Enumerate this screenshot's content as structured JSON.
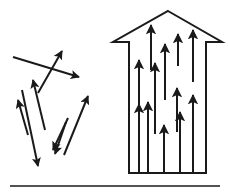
{
  "figure": {
    "canvas": {
      "width": 228,
      "height": 193,
      "background": "#ffffff"
    },
    "stroke_color": "#1a1a1a",
    "panels": [
      {
        "id": "disordered-vectors-panel",
        "name": "random-arrow-cluster",
        "label": "",
        "description": "cluster of randomly oriented arrows",
        "arrow_count": 8,
        "arrow_stroke_width": 2.0,
        "arrows": [
          {
            "name": "arrow-long-right-down",
            "x1": 13,
            "y1": 57,
            "x2": 79,
            "y2": 77
          },
          {
            "name": "arrow-up-right-steep",
            "x1": 38,
            "y1": 93,
            "x2": 62,
            "y2": 51
          },
          {
            "name": "arrow-up-left-mid",
            "x1": 45,
            "y1": 130,
            "x2": 33,
            "y2": 80
          },
          {
            "name": "arrow-up-left-lower",
            "x1": 28,
            "y1": 135,
            "x2": 18,
            "y2": 100
          },
          {
            "name": "arrow-down-left-long",
            "x1": 22,
            "y1": 90,
            "x2": 38,
            "y2": 166
          },
          {
            "name": "arrow-down-left-short",
            "x1": 68,
            "y1": 118,
            "x2": 53,
            "y2": 150
          },
          {
            "name": "arrow-down-left-thin",
            "x1": 66,
            "y1": 122,
            "x2": 55,
            "y2": 154
          },
          {
            "name": "arrow-up-right-lower",
            "x1": 64,
            "y1": 155,
            "x2": 88,
            "y2": 96
          }
        ]
      },
      {
        "id": "aligned-vectors-panel",
        "name": "arrow-outline-with-aligned-arrows",
        "label": "",
        "description": "large upward arrow outline filled with parallel upward arrows",
        "outline": {
          "name": "big-arrow-outline",
          "stroke_width": 2.0,
          "apex_x": 168,
          "apex_y": 11,
          "wing_left_x": 113,
          "wing_right_x": 222,
          "wing_y": 42,
          "body_left_x": 129,
          "body_right_x": 206,
          "body_bottom_y": 173,
          "points": "168,11 222,42 206,42 206,173 129,173 129,42 113,42"
        },
        "arrow_count": 12,
        "arrow_stroke_width": 2.0,
        "arrows": [
          {
            "name": "aligned-arrow-1",
            "x": 139,
            "y_tail": 112,
            "y_head": 60
          },
          {
            "name": "aligned-arrow-2",
            "x": 139,
            "y_tail": 172,
            "y_head": 104
          },
          {
            "name": "aligned-arrow-3",
            "x": 151,
            "y_tail": 70,
            "y_head": 25
          },
          {
            "name": "aligned-arrow-4",
            "x": 155,
            "y_tail": 134,
            "y_head": 63
          },
          {
            "name": "aligned-arrow-5",
            "x": 148,
            "y_tail": 172,
            "y_head": 102
          },
          {
            "name": "aligned-arrow-6",
            "x": 164,
            "y_tail": 172,
            "y_head": 125
          },
          {
            "name": "aligned-arrow-7",
            "x": 165,
            "y_tail": 100,
            "y_head": 44
          },
          {
            "name": "aligned-arrow-8",
            "x": 177,
            "y_tail": 132,
            "y_head": 88
          },
          {
            "name": "aligned-arrow-9",
            "x": 178,
            "y_tail": 66,
            "y_head": 34
          },
          {
            "name": "aligned-arrow-10",
            "x": 180,
            "y_tail": 172,
            "y_head": 112
          },
          {
            "name": "aligned-arrow-11",
            "x": 193,
            "y_tail": 172,
            "y_head": 95
          },
          {
            "name": "aligned-arrow-12",
            "x": 193,
            "y_tail": 82,
            "y_head": 30
          }
        ]
      }
    ],
    "baseline_rule": {
      "name": "bottom-horizontal-rule",
      "x1": 10,
      "x2": 220,
      "y": 186,
      "stroke_width": 1.4
    }
  }
}
